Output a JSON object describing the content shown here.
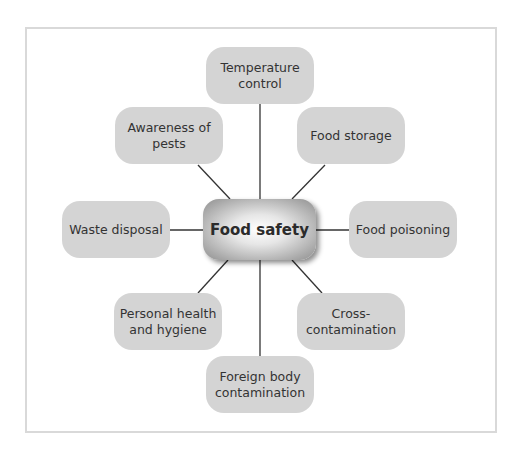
{
  "diagram": {
    "center": {
      "label": "Food safety"
    },
    "nodes": [
      {
        "id": "temperature-control",
        "line1": "Temperature",
        "line2": "control"
      },
      {
        "id": "food-storage",
        "line1": "Food storage",
        "line2": ""
      },
      {
        "id": "food-poisoning",
        "line1": "Food poisoning",
        "line2": ""
      },
      {
        "id": "cross-contamination",
        "line1": "Cross-",
        "line2": "contamination"
      },
      {
        "id": "foreign-body-contamination",
        "line1": "Foreign body",
        "line2": "contamination"
      },
      {
        "id": "personal-health-hygiene",
        "line1": "Personal health",
        "line2": "and hygiene"
      },
      {
        "id": "waste-disposal",
        "line1": "Waste disposal",
        "line2": ""
      },
      {
        "id": "awareness-of-pests",
        "line1": "Awareness of",
        "line2": "pests"
      }
    ],
    "colors": {
      "node_fill": "#d4d4d4",
      "line": "#333333",
      "frame": "#d9d9d9"
    }
  }
}
